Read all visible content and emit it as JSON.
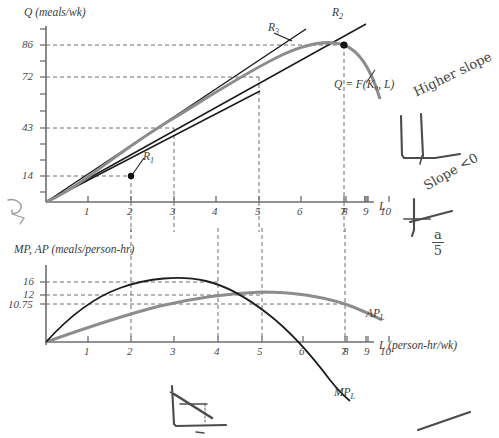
{
  "figure": {
    "background": "#ffffff",
    "ink_black": "#1c1c1c",
    "ink_grey": "#8c8c8c",
    "label_grey": "#3b3b3b"
  },
  "top_panel": {
    "y_axis_title": "Q (meals/wk)",
    "x_axis_title": "L",
    "y_ticklabels": [
      "14",
      "43",
      "72",
      "86"
    ],
    "x_ticklabels": [
      "1",
      "2",
      "3",
      "4",
      "5",
      "6",
      "7",
      "8",
      "9",
      "10"
    ],
    "curve_label": "Q = F(K₀, L)",
    "ray_labels": [
      "R",
      "R",
      "R"
    ],
    "ray_subs": [
      "1",
      "2",
      "3"
    ]
  },
  "bottom_panel": {
    "y_axis_title": "MP, AP (meals/person-hr)",
    "x_axis_title": "L (person-hr/wk)",
    "y_ticklabels": [
      "16",
      "12",
      "10.75"
    ],
    "x_ticklabels": [
      "1",
      "2",
      "3",
      "4",
      "5",
      "6",
      "7",
      "8",
      "9",
      "10"
    ],
    "ap_label": "AP",
    "ap_sub": "L",
    "mp_label": "MP",
    "mp_sub": "L"
  },
  "annotations": {
    "note_higher_slope": "Higher slope",
    "note_slope_neg": "Slope <0",
    "note_fraction_num": "a",
    "note_fraction_den": "5"
  },
  "chart_data": [
    {
      "type": "line",
      "title": "Total product curve",
      "xlabel": "L",
      "ylabel": "Q (meals/wk)",
      "xlim": [
        0,
        10.6
      ],
      "ylim": [
        0,
        100
      ],
      "grid": false,
      "x_ticks": [
        1,
        2,
        3,
        4,
        5,
        6,
        7,
        8,
        9,
        10
      ],
      "y_ticks": [
        14,
        43,
        72,
        86
      ],
      "series": [
        {
          "name": "Q = F(K0, L)",
          "color": "#8c8c8c",
          "x": [
            0,
            0.5,
            1,
            1.5,
            2,
            2.5,
            3,
            3.5,
            4,
            4.5,
            5,
            5.5,
            6,
            6.5,
            7,
            7.5,
            8,
            8.5,
            9,
            9.5,
            10
          ],
          "y": [
            0,
            2.6,
            5.8,
            9.6,
            14,
            18.9,
            24.2,
            29.8,
            43,
            49,
            55,
            61,
            72,
            78,
            82.5,
            85,
            86,
            85.4,
            83,
            79,
            73
          ]
        },
        {
          "name": "R1",
          "color": "#1c1c1c",
          "note": "ray from origin through (2, 14), slope 7",
          "x": [
            0,
            5.0
          ],
          "y": [
            0,
            35.0
          ]
        },
        {
          "name": "R3",
          "color": "#1c1c1c",
          "note": "ray from origin through (6, 72), slope 12",
          "x": [
            0,
            7.4
          ],
          "y": [
            0,
            88.8
          ]
        },
        {
          "name": "R2",
          "color": "#1c1c1c",
          "note": "tangent ray from origin through (8, 86), slope 10.75",
          "x": [
            0,
            9.0
          ],
          "y": [
            0,
            96.75
          ]
        }
      ],
      "marked_points": [
        {
          "label": "R1 point",
          "x": 2,
          "y": 14
        },
        {
          "label": "R2 tangency",
          "x": 8,
          "y": 86
        }
      ],
      "dashed_guides": {
        "vertical_x": [
          2,
          4,
          6,
          8
        ],
        "horizontal_y": [
          14,
          43,
          72,
          86
        ]
      }
    },
    {
      "type": "line",
      "title": "Marginal and average product curves",
      "xlabel": "L (person-hr/wk)",
      "ylabel": "MP, AP (meals/person-hr)",
      "xlim": [
        0,
        10.6
      ],
      "ylim": [
        -12,
        20
      ],
      "grid": false,
      "x_ticks": [
        1,
        2,
        3,
        4,
        5,
        6,
        7,
        8,
        9,
        10
      ],
      "y_ticks": [
        10.75,
        12,
        16
      ],
      "series": [
        {
          "name": "MP_L",
          "color": "#1c1c1c",
          "x": [
            0,
            0.5,
            1,
            1.5,
            2,
            2.5,
            3,
            3.5,
            4,
            4.5,
            5,
            5.5,
            6,
            6.5,
            7,
            7.5,
            8,
            8.5,
            9,
            9.5,
            10
          ],
          "y": [
            0,
            5.0,
            8.6,
            11.4,
            13.4,
            14.8,
            15.6,
            16.0,
            16.0,
            15.6,
            14.8,
            13.6,
            12.0,
            10.0,
            7.6,
            4.0,
            0,
            -4.5,
            -9.5,
            -15,
            -21
          ]
        },
        {
          "name": "AP_L",
          "color": "#8c8c8c",
          "x": [
            0,
            0.5,
            1,
            1.5,
            2,
            2.5,
            3,
            3.5,
            4,
            4.5,
            5,
            5.5,
            6,
            6.5,
            7,
            7.5,
            8,
            8.5,
            9,
            9.5,
            10
          ],
          "y": [
            0,
            2.4,
            4.6,
            6.5,
            7.0,
            7.6,
            8.4,
            9.2,
            10.0,
            10.7,
            11.3,
            11.7,
            12.0,
            11.9,
            11.7,
            11.3,
            10.75,
            10.2,
            9.5,
            8.8,
            8.0
          ]
        }
      ],
      "dashed_guides": {
        "vertical_x": [
          2,
          4,
          6,
          8
        ],
        "horizontal_y": [
          10.75,
          12,
          16
        ]
      }
    }
  ]
}
